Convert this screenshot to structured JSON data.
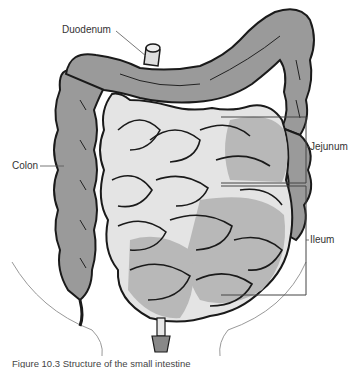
{
  "figure": {
    "caption": "Figure 10.3 Structure of the small intestine",
    "labels": {
      "duodenum": "Duodenum",
      "colon": "Colon",
      "jejunum": "Jejunum",
      "ileum": "Ileum"
    },
    "colors": {
      "colon_fill": "#9a9a9a",
      "small_intestine_light": "#e4e4e4",
      "small_intestine_mid": "#b8b8b8",
      "outline": "#1a1a1a",
      "leader_line": "#555555"
    }
  }
}
